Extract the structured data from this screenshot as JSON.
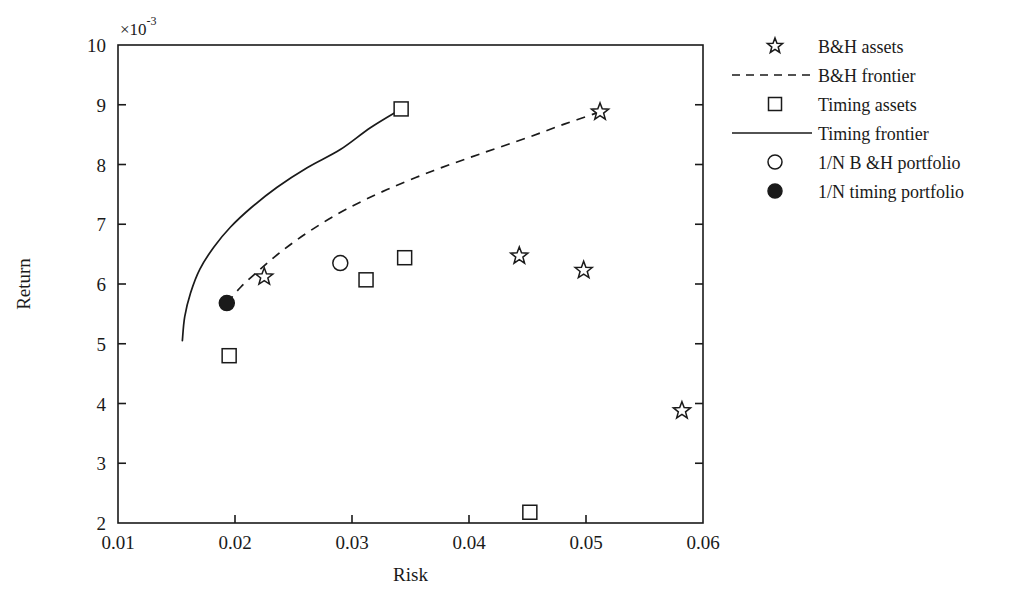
{
  "chart_data": {
    "type": "scatter",
    "title": "",
    "xlabel": "Risk",
    "ylabel": "Return",
    "y_axis_multiplier": "×10",
    "y_axis_multiplier_exponent": "-3",
    "xlim": [
      0.01,
      0.06
    ],
    "ylim": [
      2,
      10
    ],
    "grid": false,
    "legend_position": "right",
    "x_ticks": [
      "0.01",
      "0.02",
      "0.03",
      "0.04",
      "0.05",
      "0.06"
    ],
    "x_tick_values": [
      0.01,
      0.02,
      0.03,
      0.04,
      0.05,
      0.06
    ],
    "y_ticks": [
      "2",
      "3",
      "4",
      "5",
      "6",
      "7",
      "8",
      "9",
      "10"
    ],
    "y_tick_values": [
      2,
      3,
      4,
      5,
      6,
      7,
      8,
      9,
      10
    ],
    "series": [
      {
        "name": "B&H assets",
        "marker": "star-open",
        "points": [
          {
            "x": 0.0225,
            "y": 6.12
          },
          {
            "x": 0.0443,
            "y": 6.47
          },
          {
            "x": 0.0498,
            "y": 6.23
          },
          {
            "x": 0.0512,
            "y": 8.88
          },
          {
            "x": 0.0582,
            "y": 3.88
          }
        ]
      },
      {
        "name": "B&H frontier",
        "marker": "dashed-line",
        "points": [
          {
            "x": 0.0193,
            "y": 5.68
          },
          {
            "x": 0.0205,
            "y": 5.95
          },
          {
            "x": 0.022,
            "y": 6.22
          },
          {
            "x": 0.024,
            "y": 6.55
          },
          {
            "x": 0.0265,
            "y": 6.9
          },
          {
            "x": 0.0295,
            "y": 7.25
          },
          {
            "x": 0.033,
            "y": 7.58
          },
          {
            "x": 0.037,
            "y": 7.9
          },
          {
            "x": 0.041,
            "y": 8.18
          },
          {
            "x": 0.045,
            "y": 8.45
          },
          {
            "x": 0.0482,
            "y": 8.68
          },
          {
            "x": 0.0512,
            "y": 8.88
          }
        ]
      },
      {
        "name": "Timing assets",
        "marker": "square-open",
        "points": [
          {
            "x": 0.0195,
            "y": 4.8
          },
          {
            "x": 0.0312,
            "y": 6.07
          },
          {
            "x": 0.0345,
            "y": 6.44
          },
          {
            "x": 0.0342,
            "y": 8.93
          },
          {
            "x": 0.0452,
            "y": 2.18
          }
        ]
      },
      {
        "name": "Timing frontier",
        "marker": "solid-line",
        "points": [
          {
            "x": 0.0155,
            "y": 5.05
          },
          {
            "x": 0.0157,
            "y": 5.45
          },
          {
            "x": 0.0162,
            "y": 5.85
          },
          {
            "x": 0.017,
            "y": 6.25
          },
          {
            "x": 0.0182,
            "y": 6.62
          },
          {
            "x": 0.0196,
            "y": 6.95
          },
          {
            "x": 0.0214,
            "y": 7.28
          },
          {
            "x": 0.0236,
            "y": 7.62
          },
          {
            "x": 0.0262,
            "y": 7.95
          },
          {
            "x": 0.029,
            "y": 8.25
          },
          {
            "x": 0.0316,
            "y": 8.62
          },
          {
            "x": 0.0342,
            "y": 8.93
          }
        ]
      },
      {
        "name": "1/N B &H portfolio",
        "marker": "circle-open",
        "points": [
          {
            "x": 0.029,
            "y": 6.35
          }
        ]
      },
      {
        "name": "1/N timing portfolio",
        "marker": "circle-filled",
        "points": [
          {
            "x": 0.0193,
            "y": 5.68
          }
        ]
      }
    ]
  },
  "legend": {
    "items": [
      {
        "label": "B&H assets",
        "symbol": "star-open"
      },
      {
        "label": "B&H frontier",
        "symbol": "dashed-line"
      },
      {
        "label": "Timing assets",
        "symbol": "square-open"
      },
      {
        "label": "Timing frontier",
        "symbol": "solid-line"
      },
      {
        "label": "1/N B &H portfolio",
        "symbol": "circle-open"
      },
      {
        "label": "1/N timing portfolio",
        "symbol": "circle-filled"
      }
    ]
  },
  "colors": {
    "foreground": "#1a1a1a",
    "background": "#ffffff"
  }
}
